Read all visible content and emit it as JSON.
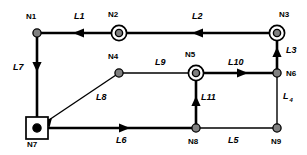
{
  "diagram": {
    "width": 307,
    "height": 155,
    "colors": {
      "background": "#ffffff",
      "stroke": "#000000",
      "node_fill": "#808080",
      "node_fill_solid": "#000000"
    },
    "nodes": [
      {
        "id": "N1",
        "label": "N1",
        "x": 37,
        "y": 33,
        "marker": "dot",
        "label_dx": -4,
        "label_dy": -17
      },
      {
        "id": "N2",
        "label": "N2",
        "x": 119,
        "y": 33,
        "marker": "double-circle",
        "label_dx": -4,
        "label_dy": -19
      },
      {
        "id": "N3",
        "label": "N3",
        "x": 277,
        "y": 33,
        "marker": "double-circle",
        "label_dx": -4,
        "label_dy": -19
      },
      {
        "id": "N4",
        "label": "N4",
        "x": 119,
        "y": 73,
        "marker": "dot",
        "label_dx": -4,
        "label_dy": -17
      },
      {
        "id": "N5",
        "label": "N5",
        "x": 196,
        "y": 73,
        "marker": "double-circle",
        "label_dx": -4,
        "label_dy": -19
      },
      {
        "id": "N6",
        "label": "N6",
        "x": 277,
        "y": 73,
        "marker": "dot",
        "label_dx": 9,
        "label_dy": -4
      },
      {
        "id": "N7",
        "label": "N7",
        "x": 37,
        "y": 128,
        "marker": "boxed-dot",
        "label_dx": -4,
        "label_dy": 11
      },
      {
        "id": "N8",
        "label": "N8",
        "x": 196,
        "y": 128,
        "marker": "dot",
        "label_dx": -4,
        "label_dy": 9
      },
      {
        "id": "N9",
        "label": "N9",
        "x": 277,
        "y": 128,
        "marker": "dot",
        "label_dx": -4,
        "label_dy": 9
      }
    ],
    "edges": [
      {
        "id": "L1",
        "label": "L1",
        "from": "N2",
        "to": "N1",
        "weight": "thick",
        "arrow": "left",
        "label_x": 74,
        "label_y": 12
      },
      {
        "id": "L2",
        "label": "L2",
        "from": "N3",
        "to": "N2",
        "weight": "thick",
        "arrow": "left",
        "label_x": 194,
        "label_y": 12
      },
      {
        "id": "L3",
        "label": "L3",
        "from": "N6",
        "to": "N3",
        "weight": "thick",
        "arrow": "up",
        "label_x": 285,
        "label_y": 48
      },
      {
        "id": "L4",
        "label": "L",
        "sub": "4",
        "from": "N6",
        "to": "N9",
        "weight": "thin",
        "arrow": "none",
        "label_x": 283,
        "label_y": 96
      },
      {
        "id": "L5",
        "label": "L5",
        "from": "N8",
        "to": "N9",
        "weight": "thin",
        "arrow": "none",
        "label_x": 231,
        "label_y": 138
      },
      {
        "id": "L6",
        "label": "L6",
        "from": "N7",
        "to": "N8",
        "weight": "thick",
        "arrow": "right",
        "label_x": 119,
        "label_y": 138
      },
      {
        "id": "L7",
        "label": "L7",
        "from": "N1",
        "to": "N7",
        "weight": "thick",
        "arrow": "down",
        "label_x": 16,
        "label_y": 65
      },
      {
        "id": "L8",
        "label": "L8",
        "from": "N7",
        "to": "N4",
        "weight": "thin",
        "arrow": "diag",
        "label_x": 98,
        "label_y": 95
      },
      {
        "id": "L9",
        "label": "L9",
        "from": "N4",
        "to": "N5",
        "weight": "thin",
        "arrow": "none",
        "label_x": 158,
        "label_y": 60
      },
      {
        "id": "L10",
        "label": "L10",
        "from": "N5",
        "to": "N6",
        "weight": "thick",
        "arrow": "right",
        "label_x": 234,
        "label_y": 60
      },
      {
        "id": "L11",
        "label": "L11",
        "from": "N8",
        "to": "N5",
        "weight": "thick",
        "arrow": "up",
        "label_x": 204,
        "label_y": 96
      }
    ]
  }
}
